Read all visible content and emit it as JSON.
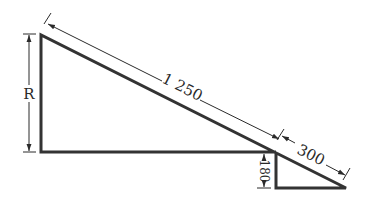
{
  "diagram": {
    "type": "geometry-dimension-drawing",
    "labels": {
      "height": "R",
      "hypotenuse_upper": "1 250",
      "hypotenuse_lower": "300",
      "step_height": "180"
    },
    "colors": {
      "outline": "#333333",
      "dimension": "#2a2a2a",
      "background": "#ffffff"
    }
  }
}
